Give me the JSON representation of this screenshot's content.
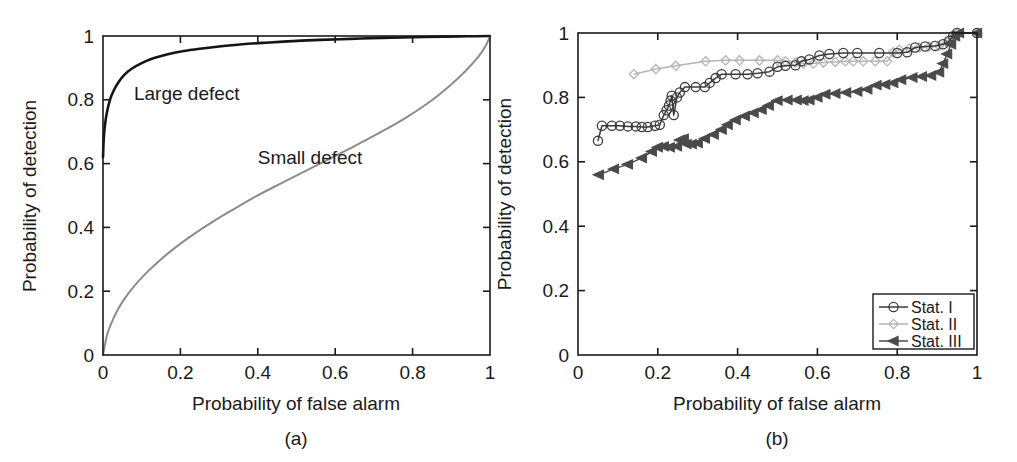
{
  "figure": {
    "background": "#ffffff",
    "panels": [
      "a",
      "b"
    ]
  },
  "panel_a": {
    "caption": "(a)",
    "xlabel": "Probability of false alarm",
    "ylabel": "Probability of detection",
    "xticks": [
      "0",
      "0.2",
      "0.4",
      "0.6",
      "0.8",
      "1"
    ],
    "yticks": [
      "0",
      "0.2",
      "0.4",
      "0.6",
      "0.8",
      "1"
    ],
    "annotations": [
      {
        "text": "Large defect",
        "x": 0.08,
        "y": 0.8
      },
      {
        "text": "Small defect",
        "x": 0.4,
        "y": 0.6
      }
    ]
  },
  "panel_b": {
    "caption": "(b)",
    "xlabel": "Probability of false alarm",
    "ylabel": "Probability of detection",
    "xticks": [
      "0",
      "0.2",
      "0.4",
      "0.6",
      "0.8",
      "1"
    ],
    "yticks": [
      "0",
      "0.2",
      "0.4",
      "0.6",
      "0.8",
      "1"
    ],
    "legend": {
      "position": "bottom-right",
      "items": [
        {
          "label": "Stat. I",
          "marker": "circle-icon",
          "color": "#3b3b3b"
        },
        {
          "label": "Stat. II",
          "marker": "diamond-icon",
          "color": "#b5b5b5"
        },
        {
          "label": "Stat. III",
          "marker": "triangle-left-icon",
          "color": "#4a4a4a"
        }
      ]
    }
  },
  "chart_data": [
    {
      "type": "line",
      "panel": "a",
      "title": "",
      "xlabel": "Probability of false alarm",
      "ylabel": "Probability of detection",
      "xlim": [
        0,
        1
      ],
      "ylim": [
        0,
        1
      ],
      "xticks": [
        0,
        0.2,
        0.4,
        0.6,
        0.8,
        1
      ],
      "yticks": [
        0,
        0.2,
        0.4,
        0.6,
        0.8,
        1
      ],
      "grid": false,
      "legend": "none (inline text annotations)",
      "series": [
        {
          "name": "Large defect",
          "color": "#141414",
          "annotation": "Large defect",
          "points": [
            [
              0.0,
              0.62
            ],
            [
              0.002,
              0.68
            ],
            [
              0.005,
              0.72
            ],
            [
              0.01,
              0.76
            ],
            [
              0.018,
              0.8
            ],
            [
              0.028,
              0.83
            ],
            [
              0.04,
              0.855
            ],
            [
              0.055,
              0.878
            ],
            [
              0.075,
              0.898
            ],
            [
              0.1,
              0.915
            ],
            [
              0.13,
              0.93
            ],
            [
              0.165,
              0.942
            ],
            [
              0.205,
              0.952
            ],
            [
              0.25,
              0.96
            ],
            [
              0.3,
              0.967
            ],
            [
              0.36,
              0.974
            ],
            [
              0.42,
              0.979
            ],
            [
              0.49,
              0.984
            ],
            [
              0.56,
              0.988
            ],
            [
              0.64,
              0.991
            ],
            [
              0.72,
              0.994
            ],
            [
              0.8,
              0.996
            ],
            [
              0.88,
              0.998
            ],
            [
              0.94,
              0.999
            ],
            [
              1.0,
              1.0
            ]
          ]
        },
        {
          "name": "Small defect",
          "color": "#8c8c8c",
          "annotation": "Small defect",
          "points": [
            [
              0.0,
              0.0
            ],
            [
              0.01,
              0.06
            ],
            [
              0.02,
              0.095
            ],
            [
              0.035,
              0.135
            ],
            [
              0.055,
              0.175
            ],
            [
              0.08,
              0.215
            ],
            [
              0.11,
              0.255
            ],
            [
              0.145,
              0.295
            ],
            [
              0.185,
              0.335
            ],
            [
              0.23,
              0.375
            ],
            [
              0.28,
              0.415
            ],
            [
              0.335,
              0.455
            ],
            [
              0.395,
              0.497
            ],
            [
              0.455,
              0.535
            ],
            [
              0.52,
              0.575
            ],
            [
              0.585,
              0.615
            ],
            [
              0.65,
              0.655
            ],
            [
              0.715,
              0.697
            ],
            [
              0.78,
              0.742
            ],
            [
              0.84,
              0.79
            ],
            [
              0.89,
              0.838
            ],
            [
              0.935,
              0.888
            ],
            [
              0.97,
              0.935
            ],
            [
              0.99,
              0.972
            ],
            [
              1.0,
              1.0
            ]
          ]
        }
      ]
    },
    {
      "type": "line",
      "panel": "b",
      "title": "",
      "xlabel": "Probability of false alarm",
      "ylabel": "Probability of detection",
      "xlim": [
        0,
        1
      ],
      "ylim": [
        0,
        1
      ],
      "xticks": [
        0,
        0.2,
        0.4,
        0.6,
        0.8,
        1
      ],
      "yticks": [
        0,
        0.2,
        0.4,
        0.6,
        0.8,
        1
      ],
      "grid": false,
      "legend": "bottom-right",
      "series": [
        {
          "name": "Stat. I",
          "marker": "circle",
          "color": "#3b3b3b",
          "points": [
            [
              0.05,
              0.665
            ],
            [
              0.06,
              0.712
            ],
            [
              0.085,
              0.712
            ],
            [
              0.105,
              0.712
            ],
            [
              0.125,
              0.71
            ],
            [
              0.145,
              0.71
            ],
            [
              0.16,
              0.708
            ],
            [
              0.175,
              0.708
            ],
            [
              0.193,
              0.712
            ],
            [
              0.205,
              0.715
            ],
            [
              0.215,
              0.745
            ],
            [
              0.222,
              0.76
            ],
            [
              0.228,
              0.775
            ],
            [
              0.232,
              0.79
            ],
            [
              0.235,
              0.805
            ],
            [
              0.24,
              0.745
            ],
            [
              0.248,
              0.8
            ],
            [
              0.255,
              0.815
            ],
            [
              0.268,
              0.832
            ],
            [
              0.295,
              0.832
            ],
            [
              0.318,
              0.832
            ],
            [
              0.33,
              0.845
            ],
            [
              0.345,
              0.86
            ],
            [
              0.36,
              0.872
            ],
            [
              0.395,
              0.872
            ],
            [
              0.425,
              0.872
            ],
            [
              0.45,
              0.875
            ],
            [
              0.48,
              0.88
            ],
            [
              0.5,
              0.895
            ],
            [
              0.52,
              0.898
            ],
            [
              0.545,
              0.9
            ],
            [
              0.56,
              0.912
            ],
            [
              0.58,
              0.918
            ],
            [
              0.605,
              0.93
            ],
            [
              0.63,
              0.935
            ],
            [
              0.665,
              0.938
            ],
            [
              0.7,
              0.938
            ],
            [
              0.755,
              0.938
            ],
            [
              0.8,
              0.938
            ],
            [
              0.825,
              0.94
            ],
            [
              0.845,
              0.955
            ],
            [
              0.87,
              0.958
            ],
            [
              0.895,
              0.96
            ],
            [
              0.915,
              0.965
            ],
            [
              0.93,
              0.975
            ],
            [
              0.94,
              0.99
            ],
            [
              0.95,
              1.0
            ],
            [
              1.0,
              1.0
            ]
          ]
        },
        {
          "name": "Stat. II",
          "marker": "diamond",
          "color": "#b5b5b5",
          "points": [
            [
              0.14,
              0.872
            ],
            [
              0.195,
              0.888
            ],
            [
              0.245,
              0.898
            ],
            [
              0.32,
              0.912
            ],
            [
              0.37,
              0.915
            ],
            [
              0.405,
              0.915
            ],
            [
              0.455,
              0.915
            ],
            [
              0.5,
              0.915
            ],
            [
              0.52,
              0.912
            ],
            [
              0.545,
              0.908
            ],
            [
              0.565,
              0.905
            ],
            [
              0.59,
              0.905
            ],
            [
              0.615,
              0.908
            ],
            [
              0.645,
              0.91
            ],
            [
              0.67,
              0.912
            ],
            [
              0.69,
              0.912
            ],
            [
              0.715,
              0.912
            ],
            [
              0.745,
              0.912
            ],
            [
              0.775,
              0.912
            ],
            [
              0.79,
              0.94
            ],
            [
              0.805,
              0.948
            ],
            [
              0.83,
              0.952
            ],
            [
              0.855,
              0.955
            ],
            [
              0.88,
              0.958
            ],
            [
              0.905,
              0.96
            ],
            [
              0.925,
              0.97
            ],
            [
              0.94,
              0.985
            ],
            [
              0.95,
              1.0
            ],
            [
              1.0,
              1.0
            ]
          ]
        },
        {
          "name": "Stat. III",
          "marker": "triangle-left",
          "color": "#4a4a4a",
          "points": [
            [
              0.052,
              0.56
            ],
            [
              0.09,
              0.578
            ],
            [
              0.125,
              0.592
            ],
            [
              0.16,
              0.612
            ],
            [
              0.185,
              0.632
            ],
            [
              0.2,
              0.645
            ],
            [
              0.215,
              0.648
            ],
            [
              0.23,
              0.645
            ],
            [
              0.248,
              0.648
            ],
            [
              0.255,
              0.668
            ],
            [
              0.265,
              0.672
            ],
            [
              0.272,
              0.655
            ],
            [
              0.285,
              0.655
            ],
            [
              0.3,
              0.658
            ],
            [
              0.318,
              0.672
            ],
            [
              0.34,
              0.685
            ],
            [
              0.36,
              0.7
            ],
            [
              0.375,
              0.715
            ],
            [
              0.395,
              0.73
            ],
            [
              0.418,
              0.742
            ],
            [
              0.44,
              0.752
            ],
            [
              0.46,
              0.762
            ],
            [
              0.478,
              0.775
            ],
            [
              0.5,
              0.79
            ],
            [
              0.525,
              0.792
            ],
            [
              0.548,
              0.792
            ],
            [
              0.565,
              0.79
            ],
            [
              0.58,
              0.792
            ],
            [
              0.6,
              0.8
            ],
            [
              0.62,
              0.81
            ],
            [
              0.645,
              0.812
            ],
            [
              0.672,
              0.815
            ],
            [
              0.7,
              0.818
            ],
            [
              0.725,
              0.825
            ],
            [
              0.748,
              0.838
            ],
            [
              0.77,
              0.84
            ],
            [
              0.79,
              0.845
            ],
            [
              0.81,
              0.855
            ],
            [
              0.838,
              0.862
            ],
            [
              0.862,
              0.865
            ],
            [
              0.885,
              0.868
            ],
            [
              0.905,
              0.878
            ],
            [
              0.915,
              0.905
            ],
            [
              0.925,
              0.935
            ],
            [
              0.935,
              0.965
            ],
            [
              0.945,
              0.99
            ],
            [
              0.955,
              1.0
            ],
            [
              1.0,
              1.0
            ]
          ]
        }
      ]
    }
  ]
}
